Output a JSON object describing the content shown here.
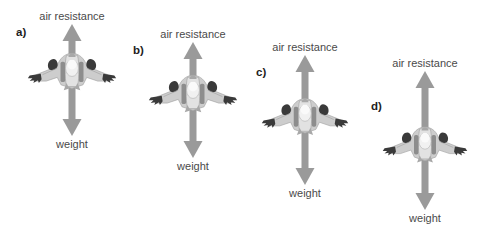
{
  "figure": {
    "background_color": "#ffffff",
    "arrow_color": "#9a9a9a",
    "label_color": "#4a4a4a",
    "index_color": "#1d1d1d",
    "plane_body_color": "#c9c9c9",
    "plane_dark_color": "#3a3a3a"
  },
  "labels": {
    "air_resistance": "air resistance",
    "weight": "weight"
  },
  "panels": [
    {
      "id": "a",
      "index_label": "a)",
      "index_x": 16,
      "index_y": 26,
      "axis_x": 72,
      "top_label": "air resistance",
      "top_label_x": 72,
      "top_label_y": 10,
      "bottom_label": "weight",
      "bottom_label_x": 72,
      "bottom_label_y": 138,
      "arrow_top_y": 24,
      "arrow_bottom_y": 136,
      "up_length": 46,
      "down_length": 66,
      "plane_cx": 72,
      "plane_cy": 70,
      "plane_width": 92,
      "plane_height": 48
    },
    {
      "id": "b",
      "index_label": "b)",
      "index_x": 133,
      "index_y": 44,
      "axis_x": 193,
      "top_label": "air resistance",
      "top_label_x": 193,
      "top_label_y": 28,
      "bottom_label": "weight",
      "bottom_label_x": 193,
      "bottom_label_y": 160,
      "arrow_top_y": 42,
      "arrow_bottom_y": 158,
      "up_length": 50,
      "down_length": 66,
      "plane_cx": 193,
      "plane_cy": 92,
      "plane_width": 92,
      "plane_height": 48
    },
    {
      "id": "c",
      "index_label": "c)",
      "index_x": 256,
      "index_y": 66,
      "axis_x": 305,
      "top_label": "air resistance",
      "top_label_x": 305,
      "top_label_y": 41,
      "bottom_label": "weight",
      "bottom_label_x": 305,
      "bottom_label_y": 187,
      "arrow_top_y": 55,
      "arrow_bottom_y": 185,
      "up_length": 60,
      "down_length": 70,
      "plane_cx": 305,
      "plane_cy": 115,
      "plane_width": 90,
      "plane_height": 47
    },
    {
      "id": "d",
      "index_label": "d)",
      "index_x": 371,
      "index_y": 100,
      "axis_x": 425,
      "top_label": "air resistance",
      "top_label_x": 425,
      "top_label_y": 57,
      "bottom_label": "weight",
      "bottom_label_x": 425,
      "bottom_label_y": 212,
      "arrow_top_y": 71,
      "arrow_bottom_y": 210,
      "up_length": 72,
      "down_length": 67,
      "plane_cx": 425,
      "plane_cy": 143,
      "plane_width": 88,
      "plane_height": 46
    }
  ]
}
